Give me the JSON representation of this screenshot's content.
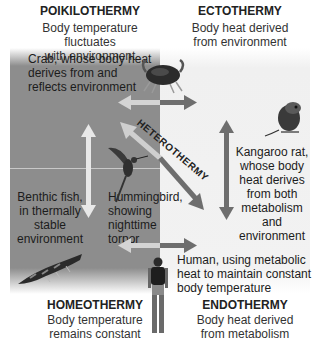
{
  "quadrants": {
    "poikilothermy": {
      "title": "POIKILOTHERMY",
      "desc": [
        "Body temperature fluctuates",
        "with environment"
      ]
    },
    "ectothermy": {
      "title": "ECTOTHERMY",
      "desc": [
        "Body heat derived",
        "from environment"
      ]
    },
    "homeothermy": {
      "title": "HOMEOTHERMY",
      "desc": [
        "Body temperature",
        "remains constant"
      ]
    },
    "endothermy": {
      "title": "ENDOTHERMY",
      "desc": [
        "Body heat derived",
        "from metabolism"
      ]
    }
  },
  "diagonal_label": "HETEROTHERMY",
  "examples": {
    "crab": [
      "Crab, whose body heat",
      "derives from and",
      "reflects environment"
    ],
    "benthic_fish": [
      "Benthic fish,",
      "in thermally",
      "stable",
      "environment"
    ],
    "hummingbird": [
      "Hummingbird,",
      "showing",
      "nighttime",
      "torpor"
    ],
    "kangaroo_rat": [
      "Kangaroo rat,",
      "whose body",
      "heat derives",
      "from both",
      "metabolism",
      "and environment"
    ],
    "human": [
      "Human, using metabolic",
      "heat to maintain constant",
      "body temperature"
    ]
  },
  "colors": {
    "gray_panel": "#8d8d8d",
    "light_arrow": "#d4d4d4",
    "dark_arrow": "#6e6e6e",
    "white_panel": "#f2f2f2"
  }
}
